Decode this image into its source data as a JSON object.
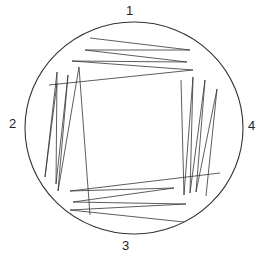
{
  "diagram": {
    "plate": {
      "cx": 134,
      "cy": 128,
      "rx": 109,
      "ry": 106,
      "stroke": "#333333"
    },
    "labels": {
      "q1": "1",
      "q2": "2",
      "q3": "3",
      "q4": "4"
    },
    "streaks": {
      "quadrant1": "90,38 190,50 85,50 187,62 72,61 193,70 49,85",
      "quadrant2": "57,83 45,177 57,72 56,184 68,75 58,191 79,67 90,215",
      "quadrant4": "181,80 184,195 193,77 190,193 205,80 196,192 217,89 206,196",
      "quadrant3": "220,173 70,191 174,188 73,202 186,204 70,210 184,222"
    }
  }
}
